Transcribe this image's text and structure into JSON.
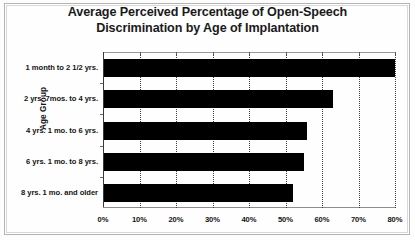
{
  "chart_data": {
    "type": "bar",
    "orientation": "horizontal",
    "title": "Average Perceived Percentage of Open-Speech Discrimination by Age of Implantation",
    "title_lines": [
      "Average Perceived Percentage of Open-Speech",
      "Discrimination by Age of Implantation"
    ],
    "ylabel": "Age Group",
    "xlabel": "",
    "categories": [
      "1 month to 2 1/2 yrs.",
      "2 yrs. 7mos. to 4 yrs.",
      "4 yrs. 1 mo. to 6 yrs.",
      "6 yrs. 1 mo. to 8 yrs.",
      "8 yrs. 1 mo. and older"
    ],
    "values": [
      80,
      63,
      56,
      55,
      52
    ],
    "xlim": [
      0,
      80
    ],
    "xticks": [
      0,
      10,
      20,
      30,
      40,
      50,
      60,
      70,
      80
    ],
    "xtick_labels": [
      "0%",
      "10%",
      "20%",
      "30%",
      "40%",
      "50%",
      "60%",
      "70%",
      "80%"
    ],
    "grid": "vertical-dotted",
    "legend": null,
    "bar_color": "#000000",
    "series": [
      {
        "name": "Average perceived percentage of open-speech discrimination",
        "values": [
          80,
          63,
          56,
          55,
          52
        ]
      }
    ]
  }
}
